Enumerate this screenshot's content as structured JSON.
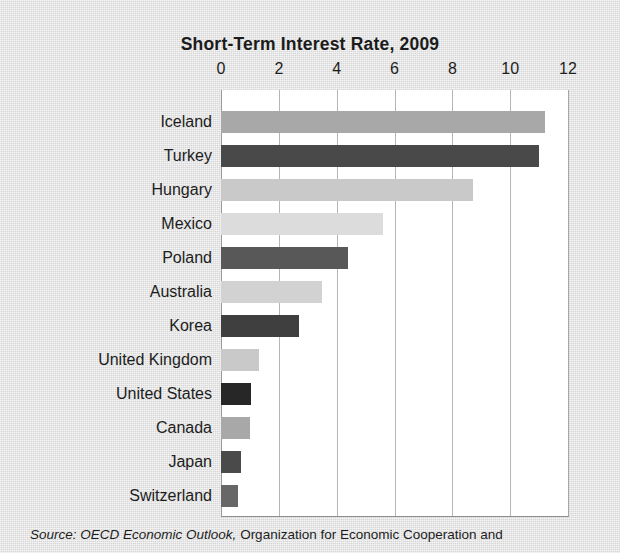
{
  "figure": {
    "title": "Short-Term Interest Rate, 2009",
    "source_lead": "Source:",
    "source_publication": "OECD Economic Outlook,",
    "source_rest": "Organization for Economic Cooperation and"
  },
  "colors": {
    "page_background": "#dcdcdc",
    "plot_background": "#ffffff",
    "gridline": "#b5b5b5",
    "axis": "#8f8f8f",
    "text": "#1d1d1d",
    "bar_light": "#dcdcdc",
    "bar_light_gray": "#c9c9c9",
    "bar_medium": "#a8a8a8",
    "bar_dark_gray": "#585858",
    "bar_dark": "#3f3f3f"
  },
  "chart_data": {
    "type": "bar",
    "orientation": "horizontal",
    "title": "Short-Term Interest Rate, 2009",
    "xlabel": "",
    "ylabel": "",
    "xlim": [
      0,
      12
    ],
    "xticks": [
      0,
      2,
      4,
      6,
      8,
      10,
      12
    ],
    "xtick_labels": [
      "0",
      "2",
      "4",
      "6",
      "8",
      "10",
      "12"
    ],
    "grid": "vertical",
    "legend": "none",
    "categories": [
      "Iceland",
      "Turkey",
      "Hungary",
      "Mexico",
      "Poland",
      "Australia",
      "Korea",
      "United Kingdom",
      "United States",
      "Canada",
      "Japan",
      "Switzerland"
    ],
    "values": [
      11.2,
      11.0,
      8.7,
      5.6,
      4.4,
      3.5,
      2.7,
      1.3,
      1.05,
      1.0,
      0.7,
      0.6
    ],
    "bar_colors": [
      "#a8a8a8",
      "#494949",
      "#c9c9c9",
      "#dcdcdc",
      "#585858",
      "#d2d2d2",
      "#3f3f3f",
      "#c9c9c9",
      "#272727",
      "#a8a8a8",
      "#4a4a4a",
      "#676767"
    ]
  }
}
